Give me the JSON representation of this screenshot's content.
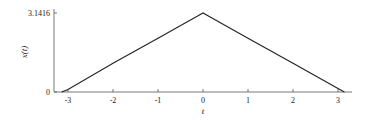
{
  "chart_data": {
    "type": "line",
    "title": "",
    "xlabel": "t",
    "ylabel": "x(t)",
    "xlim": [
      -3.3,
      3.3
    ],
    "ylim": [
      0,
      3.1416
    ],
    "xticks": [
      -3,
      -2,
      -1,
      0,
      1,
      2,
      3
    ],
    "xtick_labels": [
      "-3",
      "-2",
      "-1",
      "0",
      "1",
      "2",
      "3"
    ],
    "yticks": [
      0,
      3.1416
    ],
    "ytick_labels": [
      "0",
      "3.1416"
    ],
    "grid": false,
    "legend": null,
    "series": [
      {
        "name": "x(t)",
        "x": [
          -3.1416,
          -3.0,
          -2.0,
          -1.0,
          -0.1,
          0.0,
          0.1,
          1.0,
          2.0,
          3.0,
          3.1416
        ],
        "values": [
          0.0,
          0.1,
          1.14,
          2.14,
          3.04,
          3.1416,
          3.04,
          2.14,
          1.14,
          0.14,
          0.0
        ]
      }
    ]
  }
}
